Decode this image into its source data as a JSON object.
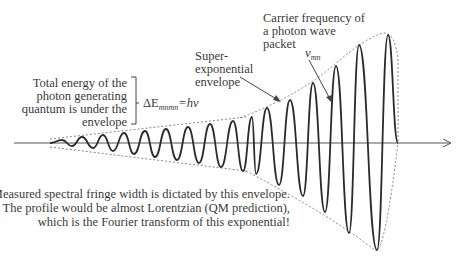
{
  "diagram": {
    "type": "photon wave packet with exponential envelope",
    "colors": {
      "wave": "#2b2b2b",
      "axis": "#555555",
      "envelope": "#777777",
      "text": "#3a3a3a"
    },
    "labels": {
      "total_energy": [
        "Total energy of the",
        "photon generating",
        "quantum is under the",
        "envelope"
      ],
      "energy_formula": {
        "delta": "ΔE",
        "subscript": "mnmn",
        "rest": "=hν"
      },
      "super_exponential": [
        "Super-",
        "exponential",
        "envelope"
      ],
      "carrier_frequency": [
        "Carrier frequency of",
        "a photon wave",
        "packet"
      ],
      "nu_symbol": "ν",
      "nu_subscript": "mn",
      "bottom_note": [
        "Measured spectral fringe width is dictated by this envelope.",
        "The profile would be almost Lorentzian (QM prediction),",
        "which is the Fourier transform of this exponential!"
      ]
    },
    "wave": {
      "start_x": 50,
      "end_x": 398,
      "axis_y": 143,
      "peaks": [
        [
          62,
          140
        ],
        [
          82,
          137
        ],
        [
          103,
          135
        ],
        [
          124,
          133
        ],
        [
          145,
          131
        ],
        [
          166,
          129
        ],
        [
          188,
          127
        ],
        [
          210,
          124
        ],
        [
          233,
          121
        ],
        [
          252,
          117
        ],
        [
          267,
          108
        ],
        [
          290,
          100
        ],
        [
          313,
          83
        ],
        [
          336,
          66
        ],
        [
          359,
          45
        ],
        [
          388,
          35
        ]
      ],
      "troughs": [
        [
          72,
          146
        ],
        [
          93,
          148
        ],
        [
          113,
          151
        ],
        [
          134,
          154
        ],
        [
          155,
          157
        ],
        [
          177,
          160
        ],
        [
          199,
          163
        ],
        [
          221,
          167
        ],
        [
          243,
          171
        ],
        [
          256,
          174
        ],
        [
          279,
          185
        ],
        [
          303,
          196
        ],
        [
          325,
          212
        ],
        [
          349,
          233
        ],
        [
          377,
          250
        ]
      ]
    }
  }
}
